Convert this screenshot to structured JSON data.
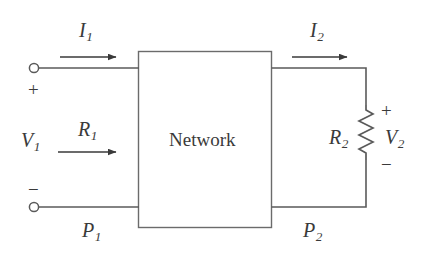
{
  "figure": {
    "type": "circuit-diagram",
    "background_color": "#ffffff",
    "line_color": "#4a4a4a",
    "text_color": "#3a3a3a"
  },
  "block": {
    "label": "Network"
  },
  "labels": {
    "current_in": {
      "symbol": "I",
      "subscript": "1"
    },
    "current_out": {
      "symbol": "I",
      "subscript": "2"
    },
    "voltage_in": {
      "symbol": "V",
      "subscript": "1"
    },
    "voltage_out": {
      "symbol": "V",
      "subscript": "2"
    },
    "resistance_in": {
      "symbol": "R",
      "subscript": "1"
    },
    "resistance_load": {
      "symbol": "R",
      "subscript": "2"
    },
    "power_in": {
      "symbol": "P",
      "subscript": "1"
    },
    "power_out": {
      "symbol": "P",
      "subscript": "2"
    }
  },
  "polarity": {
    "input_plus": "+",
    "input_minus": "−",
    "output_plus": "+",
    "output_minus": "−"
  },
  "components": {
    "resistor": {
      "name": "R2",
      "style": "zigzag",
      "orientation": "vertical"
    },
    "terminals": [
      {
        "name": "input-top-terminal",
        "shape": "open-circle"
      },
      {
        "name": "input-bottom-terminal",
        "shape": "open-circle"
      }
    ],
    "arrows": [
      {
        "name": "i1-arrow",
        "direction": "right"
      },
      {
        "name": "i2-arrow",
        "direction": "right"
      },
      {
        "name": "r1-arrow",
        "direction": "right"
      }
    ]
  }
}
